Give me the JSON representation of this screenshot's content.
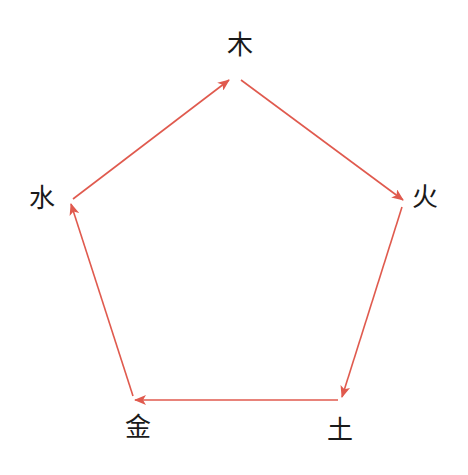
{
  "diagram": {
    "title": "",
    "edge_color": "#e05a4e",
    "text_color": "#1a1a1a",
    "nodes": [
      {
        "id": "wood",
        "label": "木",
        "x": 240,
        "y": 45
      },
      {
        "id": "fire",
        "label": "火",
        "x": 425,
        "y": 197
      },
      {
        "id": "earth",
        "label": "土",
        "x": 340,
        "y": 430
      },
      {
        "id": "metal",
        "label": "金",
        "x": 138,
        "y": 427
      },
      {
        "id": "water",
        "label": "水",
        "x": 42,
        "y": 198
      }
    ],
    "edges": [
      {
        "from": "water",
        "to": "wood",
        "x1": 73,
        "y1": 199,
        "x2": 229,
        "y2": 80
      },
      {
        "from": "wood",
        "to": "fire",
        "x1": 241,
        "y1": 80,
        "x2": 403,
        "y2": 200
      },
      {
        "from": "fire",
        "to": "earth",
        "x1": 402,
        "y1": 207,
        "x2": 342,
        "y2": 397
      },
      {
        "from": "earth",
        "to": "metal",
        "x1": 338,
        "y1": 400,
        "x2": 135,
        "y2": 400
      },
      {
        "from": "metal",
        "to": "water",
        "x1": 133,
        "y1": 396,
        "x2": 71,
        "y2": 204
      }
    ]
  }
}
